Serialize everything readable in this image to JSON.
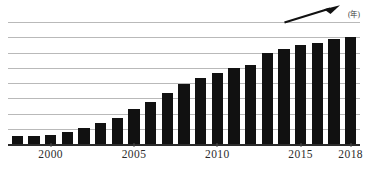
{
  "chart_data": {
    "type": "bar",
    "title": "",
    "subtitle": "",
    "xlabel": "(年)",
    "ylabel": "",
    "grid": true,
    "gridline_count": 8,
    "legend": null,
    "legend_position": "none",
    "ylim": [
      0,
      8
    ],
    "xlim": [
      1998,
      2018
    ],
    "categories": [
      "1998",
      "1999",
      "2000",
      "2001",
      "2002",
      "2003",
      "2004",
      "2005",
      "2006",
      "2007",
      "2008",
      "2009",
      "2010",
      "2011",
      "2012",
      "2013",
      "2014",
      "2015",
      "2016",
      "2017",
      "2018"
    ],
    "values": [
      0.55,
      0.55,
      0.58,
      0.78,
      1.05,
      1.38,
      1.7,
      2.28,
      2.75,
      3.32,
      3.95,
      4.3,
      4.65,
      5.0,
      5.15,
      5.95,
      6.25,
      6.5,
      6.65,
      6.9,
      7.0
    ],
    "tick_labels": [
      "2000",
      "2005",
      "2010",
      "2015",
      "2018"
    ],
    "tick_values": [
      2000,
      2005,
      2010,
      2015,
      2018
    ],
    "bar_color": "#111111",
    "gridline_color": "#b9b9b9",
    "axis_color": "#2b2b2b",
    "annotations": [
      {
        "name": "upward-trend-arrow",
        "type": "arrow",
        "color": "#111111",
        "from_year": 2015,
        "to_year": 2018,
        "direction": "up-right"
      }
    ]
  },
  "axis": {
    "unit_label": "(年)"
  }
}
